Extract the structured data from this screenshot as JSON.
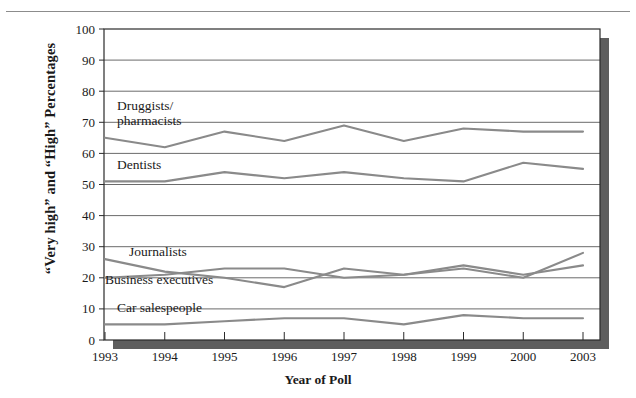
{
  "figure": {
    "top_rule": "horizontal-rule",
    "ylabel": "“Very high” and “High” Percentages",
    "xlabel": "Year of Poll"
  },
  "chart_data": {
    "type": "line",
    "title": "",
    "xlabel": "Year of Poll",
    "ylabel": "“Very high” and “High” Percentages",
    "categories": [
      "1993",
      "1994",
      "1995",
      "1996",
      "1997",
      "1998",
      "1999",
      "2000",
      "2003"
    ],
    "ylim": [
      0,
      100
    ],
    "ytick_step": 10,
    "yticks": [
      0,
      10,
      20,
      30,
      40,
      50,
      60,
      70,
      80,
      90,
      100
    ],
    "grid": true,
    "legend": "inline-annotations",
    "line_color": "#8a8a8a",
    "series": [
      {
        "name": "Druggists/\npharmacists",
        "label_line1": "Druggists/",
        "label_line2": "pharmacists",
        "values": [
          65,
          62,
          67,
          64,
          69,
          64,
          68,
          67,
          67
        ]
      },
      {
        "name": "Dentists",
        "label_line1": "Dentists",
        "label_line2": "",
        "values": [
          51,
          51,
          54,
          52,
          54,
          52,
          51,
          57,
          55
        ]
      },
      {
        "name": "Journalists",
        "label_line1": "Journalists",
        "label_line2": "",
        "values": [
          26,
          22,
          20,
          17,
          23,
          21,
          24,
          21,
          24
        ]
      },
      {
        "name": "Business executives",
        "label_line1": "Business executives",
        "label_line2": "",
        "values": [
          20,
          21,
          23,
          23,
          20,
          21,
          23,
          20,
          28
        ]
      },
      {
        "name": "Car salespeople",
        "label_line1": "Car salespeople",
        "label_line2": "",
        "values": [
          5,
          5,
          6,
          7,
          7,
          5,
          8,
          7,
          7
        ]
      }
    ],
    "annotations": [
      {
        "text": "Druggists/",
        "x": 1993.2,
        "y": 74
      },
      {
        "text": "pharmacists",
        "x": 1993.2,
        "y": 69
      },
      {
        "text": "Dentists",
        "x": 1993.2,
        "y": 55
      },
      {
        "text": "Journalists",
        "x": 1993.4,
        "y": 27
      },
      {
        "text": "Business executives",
        "x": 1993.0,
        "y": 18
      },
      {
        "text": "Car salespeople",
        "x": 1993.2,
        "y": 9
      }
    ]
  }
}
